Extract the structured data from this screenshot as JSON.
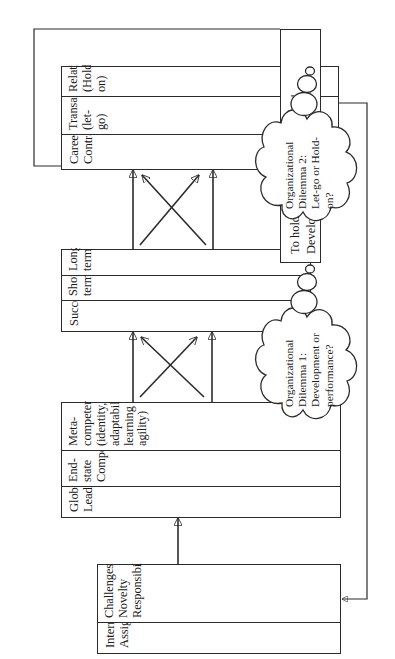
{
  "diagram": {
    "orientation": "rotated-90-ccw",
    "line_color": "#2b2b2b",
    "background": "#ffffff",
    "boxes": [
      {
        "id": "international-assignment",
        "title": "International\nAssignment",
        "cells": [
          "Challenges\nNovelty\nResponsibility",
          ""
        ]
      },
      {
        "id": "global-leadership",
        "title": "Global\nLeadership",
        "cells": [
          "End-state\nCompetencies",
          "Meta-\ncompetencies\n(identity,\nadaptability,\nlearning\nagility)"
        ]
      },
      {
        "id": "success",
        "title": "Success",
        "cells": [
          "Short-term",
          "Long-term"
        ]
      },
      {
        "id": "career-contract",
        "title": "Career\nContract",
        "cells": [
          "Transactional\n(let-go)",
          "Relational\n(Hold-on)"
        ]
      }
    ],
    "note": {
      "id": "retention-note",
      "line1": "To hold on to them, let them go!",
      "line2": "Development is retention."
    },
    "clouds": [
      {
        "id": "dilemma-1",
        "line1": "Organizational",
        "line2": "Dilemma 1:",
        "line3": "Development or",
        "line4": "performance?"
      },
      {
        "id": "dilemma-2",
        "line1": "Organizational",
        "line2": "Dilemma 2:",
        "line3": "Let-go or Hold-",
        "line4": "on?"
      }
    ]
  }
}
